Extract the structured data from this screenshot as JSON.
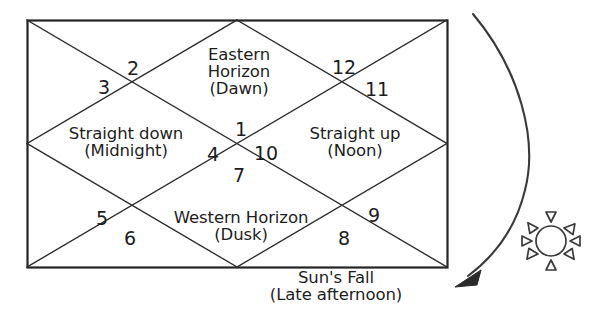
{
  "diagram": {
    "frame": {
      "label": "chart-rectangle",
      "stroke_color": "#242424",
      "background_color": "#ffffff"
    },
    "houses": [
      {
        "number": "1",
        "cx": 241,
        "cy": 130
      },
      {
        "number": "2",
        "cx": 133,
        "cy": 69
      },
      {
        "number": "3",
        "cx": 104,
        "cy": 88
      },
      {
        "number": "4",
        "cx": 213,
        "cy": 155
      },
      {
        "number": "5",
        "cx": 102,
        "cy": 219
      },
      {
        "number": "6",
        "cx": 130,
        "cy": 239
      },
      {
        "number": "7",
        "cx": 239,
        "cy": 176
      },
      {
        "number": "8",
        "cx": 344,
        "cy": 239
      },
      {
        "number": "9",
        "cx": 374,
        "cy": 216
      },
      {
        "number": "10",
        "cx": 266,
        "cy": 154
      },
      {
        "number": "11",
        "cx": 377,
        "cy": 90
      },
      {
        "number": "12",
        "cx": 344,
        "cy": 68
      }
    ],
    "zones": [
      {
        "name": "eastern-horizon",
        "lines": [
          "Eastern",
          "Horizon",
          "(Dawn)"
        ],
        "cx": 239,
        "cy": 72
      },
      {
        "name": "straight-down-midnight",
        "lines": [
          "Straight down",
          "(Midnight)"
        ],
        "cx": 126,
        "cy": 142
      },
      {
        "name": "straight-up-noon",
        "lines": [
          "Straight up",
          "(Noon)"
        ],
        "cx": 355,
        "cy": 142
      },
      {
        "name": "western-horizon",
        "lines": [
          "Western Horizon",
          "(Dusk)"
        ],
        "cx": 241,
        "cy": 226
      },
      {
        "name": "suns-fall-late-afternoon",
        "lines": [
          "Sun's Fall",
          "(Late afternoon)"
        ],
        "cx": 336,
        "cy": 286
      }
    ],
    "annotations": {
      "sun_icon_name": "sun-icon",
      "arrow_icon_name": "arrow-head-icon",
      "arc_name": "sun-path-arc"
    },
    "colors": {
      "ink": "#1d1d1d",
      "line": "#2b2b2b",
      "border": "#242424",
      "paper": "#ffffff"
    }
  }
}
